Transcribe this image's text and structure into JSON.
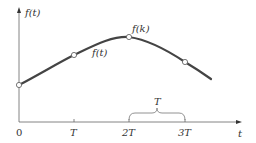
{
  "diagram": {
    "y_axis_label": "f(t)",
    "x_axis_label": "t",
    "curve_label": "f(t)",
    "peak_label": "f(k)",
    "interval_label": "T",
    "ticks": [
      {
        "label": "0",
        "x": 19
      },
      {
        "label": "T",
        "x": 74
      },
      {
        "label": "2T",
        "x": 129
      },
      {
        "label": "3T",
        "x": 185
      }
    ],
    "sample_points": [
      {
        "x": 19,
        "y": 85
      },
      {
        "x": 74,
        "y": 55
      },
      {
        "x": 129,
        "y": 37
      },
      {
        "x": 185,
        "y": 62
      }
    ],
    "colors": {
      "axis": "#555555",
      "curve": "#444444",
      "text": "#333333"
    }
  }
}
